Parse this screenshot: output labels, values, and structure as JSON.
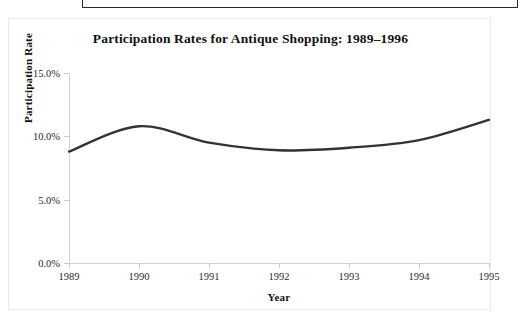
{
  "chart_data": {
    "type": "line",
    "title": "Participation Rates for Antique Shopping: 1989–1996",
    "xlabel": "Year",
    "ylabel": "Participation Rate",
    "grid": false,
    "legend": false,
    "legend_position": "none",
    "line_color": "#333333",
    "axis_color": "#d2d2d2",
    "xlim": [
      1989,
      1995
    ],
    "ylim": [
      0.0,
      15.0
    ],
    "x_tick_labels": [
      "1989",
      "1990",
      "1991",
      "1992",
      "1993",
      "1994",
      "1995"
    ],
    "x": [
      1989,
      1990,
      1991,
      1992,
      1993,
      1994,
      1995
    ],
    "y_tick_labels": [
      "15.0%",
      "10.0%",
      "5.0%",
      "0.0%"
    ],
    "y_ticks": [
      15.0,
      10.0,
      5.0,
      0.0
    ],
    "series": [
      {
        "name": "Participation Rate",
        "values": [
          8.8,
          10.8,
          9.5,
          8.9,
          9.1,
          9.7,
          11.3
        ]
      }
    ]
  },
  "chart": {
    "title": "Participation Rates for Antique Shopping: 1989–1996",
    "x_axis_title": "Year",
    "y_axis_title": "Participation Rate"
  }
}
